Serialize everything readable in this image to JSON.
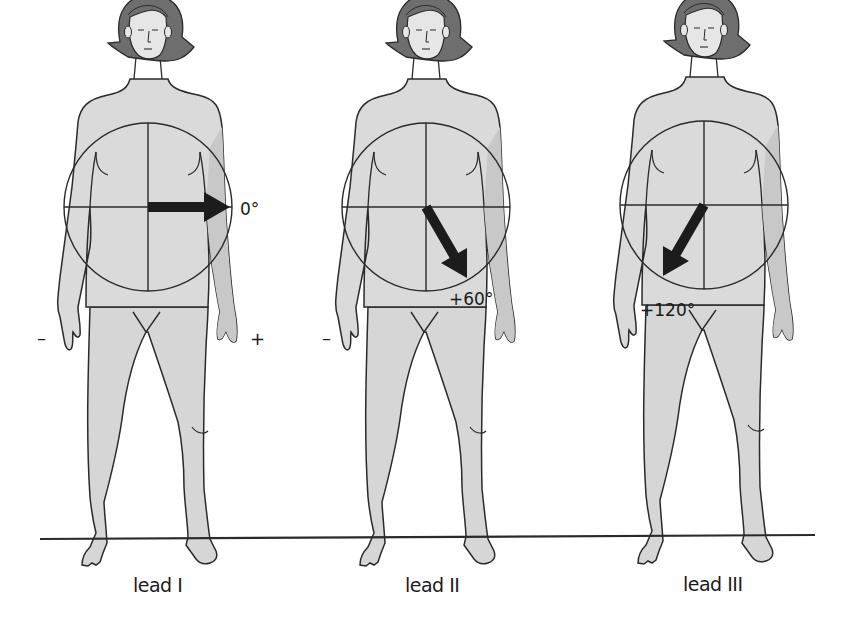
{
  "figure": {
    "colors": {
      "skin": "#dcdcdc",
      "skin_shade": "#c9c9c9",
      "hair": "#6e6e6e",
      "outline": "#2a2a2a",
      "arrow": "#1c1c1c",
      "ground": "#2a2a2a",
      "background": "#ffffff"
    },
    "ground_line_y": 539,
    "leads": [
      {
        "name": "lead I",
        "label": "lead I",
        "angle_deg": 0,
        "angle_label": "0°",
        "negative_sign": "–",
        "positive_sign": "+",
        "circle_center": [
          148,
          207
        ],
        "circle_radius": 84
      },
      {
        "name": "lead II",
        "label": "lead II",
        "angle_deg": 60,
        "angle_label": "+60°",
        "negative_sign": "–",
        "circle_center": [
          426,
          207
        ],
        "circle_radius": 84
      },
      {
        "name": "lead III",
        "label": "lead III",
        "angle_deg": 120,
        "angle_label": "+120°",
        "circle_center": [
          704,
          205
        ],
        "circle_radius": 84
      }
    ]
  }
}
